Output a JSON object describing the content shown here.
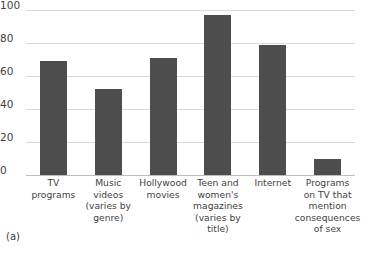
{
  "figure": {
    "panel_label": "(a)"
  },
  "chart_data": {
    "type": "bar",
    "title": "",
    "xlabel": "",
    "ylabel": "",
    "ylim": [
      0,
      100
    ],
    "yticks": [
      0,
      20,
      40,
      60,
      80,
      100
    ],
    "grid": true,
    "legend": "none",
    "bar_color": "#4d4d4d",
    "gridline_color": "#d9d9d9",
    "categories": [
      "TV\nprograms",
      "Music\nvideos\n(varies by\ngenre)",
      "Hollywood\nmovies",
      "Teen and\nwomen's\nmagazines\n(varies by\ntitle)",
      "Internet",
      "Programs\non TV that\nmention\nconsequences\nof sex"
    ],
    "category_lines": [
      [
        "TV",
        "programs"
      ],
      [
        "Music",
        "videos",
        "(varies by",
        "genre)"
      ],
      [
        "Hollywood",
        "movies"
      ],
      [
        "Teen and",
        "women's",
        "magazines",
        "(varies by",
        "title)"
      ],
      [
        "Internet"
      ],
      [
        "Programs",
        "on TV that",
        "mention",
        "consequences",
        "of sex"
      ]
    ],
    "values": [
      69,
      52,
      71,
      97,
      79,
      10
    ]
  }
}
